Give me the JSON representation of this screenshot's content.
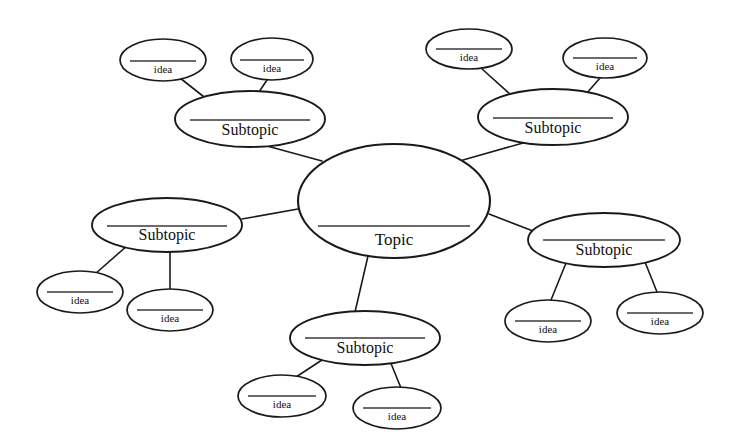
{
  "diagram": {
    "type": "mind-map",
    "background_color": "#ffffff",
    "line_color": "#1a1a1a",
    "text_color": "#111111",
    "canvas": {
      "width": 734,
      "height": 445
    },
    "nodes": [
      {
        "id": "topic",
        "label": "Topic",
        "level": "topic",
        "cx": 394,
        "cy": 201,
        "rx": 96,
        "ry": 57,
        "rule_y": 226,
        "rule_half": 76,
        "label_y": 245
      },
      {
        "id": "subtopic-top-left",
        "label": "Subtopic",
        "level": "subtopic",
        "cx": 250,
        "cy": 119,
        "rx": 75,
        "ry": 28,
        "rule_y": 120,
        "rule_half": 60,
        "label_y": 135
      },
      {
        "id": "subtopic-top-right",
        "label": "Subtopic",
        "level": "subtopic",
        "cx": 553,
        "cy": 117,
        "rx": 75,
        "ry": 28,
        "rule_y": 118,
        "rule_half": 60,
        "label_y": 133
      },
      {
        "id": "subtopic-left",
        "label": "Subtopic",
        "level": "subtopic",
        "cx": 167,
        "cy": 225,
        "rx": 75,
        "ry": 27,
        "rule_y": 226,
        "rule_half": 60,
        "label_y": 240
      },
      {
        "id": "subtopic-right",
        "label": "Subtopic",
        "level": "subtopic",
        "cx": 604,
        "cy": 240,
        "rx": 76,
        "ry": 27,
        "rule_y": 240,
        "rule_half": 61,
        "label_y": 255
      },
      {
        "id": "subtopic-bottom",
        "label": "Subtopic",
        "level": "subtopic",
        "cx": 365,
        "cy": 338,
        "rx": 75,
        "ry": 27,
        "rule_y": 338,
        "rule_half": 60,
        "label_y": 353
      },
      {
        "id": "idea-top-left-outer",
        "label": "idea",
        "level": "idea",
        "cx": 163,
        "cy": 60,
        "rx": 43,
        "ry": 21,
        "rule_y": 61,
        "rule_half": 33,
        "label_y": 73
      },
      {
        "id": "idea-top-left-inner",
        "label": "idea",
        "level": "idea",
        "cx": 272,
        "cy": 59,
        "rx": 41,
        "ry": 21,
        "rule_y": 60,
        "rule_half": 32,
        "label_y": 72
      },
      {
        "id": "idea-top-right-inner",
        "label": "idea",
        "level": "idea",
        "cx": 469,
        "cy": 49,
        "rx": 43,
        "ry": 20,
        "rule_y": 49,
        "rule_half": 33,
        "label_y": 61
      },
      {
        "id": "idea-top-right-outer",
        "label": "idea",
        "level": "idea",
        "cx": 605,
        "cy": 58,
        "rx": 42,
        "ry": 20,
        "rule_y": 58,
        "rule_half": 32,
        "label_y": 70
      },
      {
        "id": "idea-left-lower",
        "label": "idea",
        "level": "idea",
        "cx": 80,
        "cy": 292,
        "rx": 43,
        "ry": 21,
        "rule_y": 292,
        "rule_half": 33,
        "label_y": 304
      },
      {
        "id": "idea-left-right",
        "label": "idea",
        "level": "idea",
        "cx": 170,
        "cy": 310,
        "rx": 43,
        "ry": 21,
        "rule_y": 310,
        "rule_half": 33,
        "label_y": 322
      },
      {
        "id": "idea-right-left",
        "label": "idea",
        "level": "idea",
        "cx": 548,
        "cy": 321,
        "rx": 43,
        "ry": 21,
        "rule_y": 321,
        "rule_half": 33,
        "label_y": 333
      },
      {
        "id": "idea-right-right",
        "label": "idea",
        "level": "idea",
        "cx": 660,
        "cy": 313,
        "rx": 43,
        "ry": 21,
        "rule_y": 313,
        "rule_half": 33,
        "label_y": 325
      },
      {
        "id": "idea-bottom-left",
        "label": "idea",
        "level": "idea",
        "cx": 282,
        "cy": 396,
        "rx": 44,
        "ry": 21,
        "rule_y": 396,
        "rule_half": 34,
        "label_y": 408
      },
      {
        "id": "idea-bottom-right",
        "label": "idea",
        "level": "idea",
        "cx": 397,
        "cy": 408,
        "rx": 44,
        "ry": 21,
        "rule_y": 408,
        "rule_half": 34,
        "label_y": 420
      }
    ],
    "edges": [
      {
        "id": "edge-topic-subtopic-top-left",
        "from": "topic",
        "to": "subtopic-top-left",
        "x1": 322,
        "y1": 161,
        "x2": 267,
        "y2": 146
      },
      {
        "id": "edge-topic-subtopic-top-right",
        "from": "topic",
        "to": "subtopic-top-right",
        "x1": 463,
        "y1": 160,
        "x2": 523,
        "y2": 143
      },
      {
        "id": "edge-topic-subtopic-left",
        "from": "topic",
        "to": "subtopic-left",
        "x1": 298,
        "y1": 209,
        "x2": 242,
        "y2": 219
      },
      {
        "id": "edge-topic-subtopic-right",
        "from": "topic",
        "to": "subtopic-right",
        "x1": 489,
        "y1": 214,
        "x2": 533,
        "y2": 231
      },
      {
        "id": "edge-topic-subtopic-bottom",
        "from": "topic",
        "to": "subtopic-bottom",
        "x1": 368,
        "y1": 256,
        "x2": 355,
        "y2": 312
      },
      {
        "id": "edge-subtopic-top-left-idea-1",
        "from": "subtopic-top-left",
        "to": "idea-top-left-outer",
        "x1": 213,
        "y1": 104,
        "x2": 180,
        "y2": 78
      },
      {
        "id": "edge-subtopic-top-left-idea-2",
        "from": "subtopic-top-left",
        "to": "idea-top-left-inner",
        "x1": 259,
        "y1": 92,
        "x2": 267,
        "y2": 80
      },
      {
        "id": "edge-subtopic-top-right-idea-1",
        "from": "subtopic-top-right",
        "to": "idea-top-right-inner",
        "x1": 512,
        "y1": 96,
        "x2": 481,
        "y2": 68
      },
      {
        "id": "edge-subtopic-top-right-idea-2",
        "from": "subtopic-top-right",
        "to": "idea-top-right-outer",
        "x1": 586,
        "y1": 94,
        "x2": 600,
        "y2": 78
      },
      {
        "id": "edge-subtopic-left-idea-1",
        "from": "subtopic-left",
        "to": "idea-left-lower",
        "x1": 128,
        "y1": 245,
        "x2": 95,
        "y2": 274
      },
      {
        "id": "edge-subtopic-left-idea-2",
        "from": "subtopic-left",
        "to": "idea-left-right",
        "x1": 170,
        "y1": 252,
        "x2": 170,
        "y2": 289
      },
      {
        "id": "edge-subtopic-right-idea-1",
        "from": "subtopic-right",
        "to": "idea-right-left",
        "x1": 566,
        "y1": 263,
        "x2": 551,
        "y2": 300
      },
      {
        "id": "edge-subtopic-right-idea-2",
        "from": "subtopic-right",
        "to": "idea-right-right",
        "x1": 645,
        "y1": 262,
        "x2": 657,
        "y2": 292
      },
      {
        "id": "edge-subtopic-bottom-idea-1",
        "from": "subtopic-bottom",
        "to": "idea-bottom-left",
        "x1": 325,
        "y1": 358,
        "x2": 296,
        "y2": 377
      },
      {
        "id": "edge-subtopic-bottom-idea-2",
        "from": "subtopic-bottom",
        "to": "idea-bottom-right",
        "x1": 390,
        "y1": 361,
        "x2": 401,
        "y2": 388
      }
    ]
  }
}
